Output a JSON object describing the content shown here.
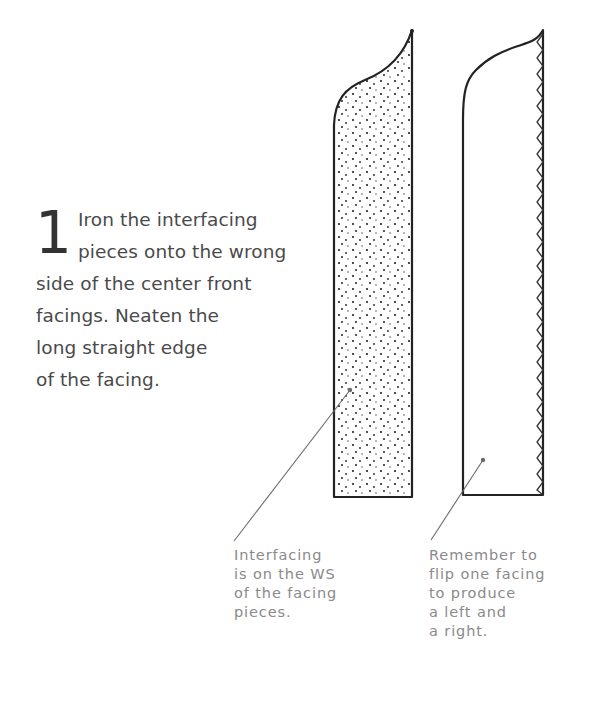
{
  "step": {
    "number": "1",
    "text": "Iron the interfacing pieces onto the wrong side of the center front facings. Neaten the long straight edge of the facing.",
    "lines": [
      "Iron the interfacing",
      "pieces onto the wrong",
      "side of the center front",
      "facings. Neaten the",
      "long straight edge",
      "of the facing."
    ]
  },
  "illustration": {
    "left_piece": "facing with interfacing (dotted texture)",
    "right_piece": "facing with zigzag neatened edge",
    "line_color": "#222222",
    "leader_color": "#6a6a6a"
  },
  "captions": {
    "interfacing": "Interfacing\nis on the WS\nof the facing\npieces.",
    "flip": "Remember to\nflip one facing\nto produce\na left and\na right."
  }
}
